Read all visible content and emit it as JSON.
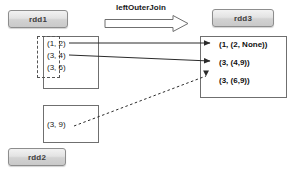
{
  "diagram": {
    "title_caption": "leftOuterJoin",
    "labels": {
      "rdd1": "rdd1",
      "rdd2": "rdd2",
      "rdd3": "rdd3"
    },
    "rdd1_items": [
      "(1, 2)",
      "(3, 4)",
      "(3, 6)"
    ],
    "rdd2_items": [
      "(3, 9)"
    ],
    "rdd3_items": [
      "(1, (2, None))",
      "(3, (4,9))",
      "(3, (6,9))"
    ],
    "colors": {
      "chip_border": "#8d8d8d",
      "chip_fill": "#dedede",
      "box_border": "#6f6f6f",
      "line": "#3a3a3a",
      "text": "#1a1a1a",
      "background": "#ffffff"
    },
    "connections": [
      {
        "from": "(1, 2)",
        "to": "(1, (2, None))",
        "style": "solid"
      },
      {
        "from": "(3, 4)",
        "to": "(3, (4,9))",
        "style": "solid"
      },
      {
        "from": "(3, 9)",
        "to": "(3, (6,9))",
        "style": "dashed"
      }
    ]
  }
}
